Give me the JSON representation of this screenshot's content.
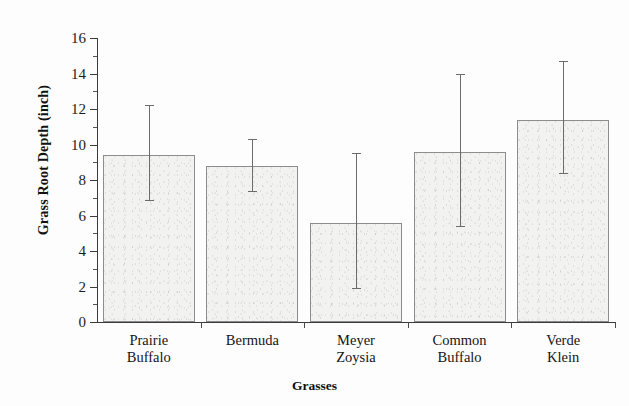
{
  "chart_data": {
    "type": "bar",
    "title": "",
    "xlabel": "Grasses",
    "ylabel": "Grass Root Depth (inch)",
    "categories": [
      "Prairie Buffalo",
      "Bermuda",
      "Meyer Zoysia",
      "Common Buffalo",
      "Verde Klein"
    ],
    "category_lines": [
      [
        "Prairie",
        "Buffalo"
      ],
      [
        "Bermuda",
        ""
      ],
      [
        "Meyer",
        "Zoysia"
      ],
      [
        "Common",
        "Buffalo"
      ],
      [
        "Verde",
        "Klein"
      ]
    ],
    "values": [
      9.4,
      8.8,
      5.6,
      9.6,
      11.4
    ],
    "error_low": [
      6.9,
      7.4,
      1.9,
      5.4,
      8.4
    ],
    "error_high": [
      12.2,
      10.3,
      9.5,
      14.0,
      14.7
    ],
    "ylim": [
      0,
      16
    ],
    "xlim_note": "categorical",
    "ytick_labels": [
      "0",
      "2",
      "4",
      "6",
      "8",
      "10",
      "12",
      "14",
      "16"
    ],
    "ytick_values": [
      0,
      2,
      4,
      6,
      8,
      10,
      12,
      14,
      16
    ],
    "yminor_values": [
      1,
      3,
      5,
      7,
      9,
      11,
      13,
      15
    ],
    "grid": false,
    "legend": null,
    "bar_fill_color": "#f2f2f0",
    "bar_edge_color": "#8d8d8d",
    "error_bar_color": "#6c6c6c",
    "axis_color": "#3a3a3a"
  }
}
